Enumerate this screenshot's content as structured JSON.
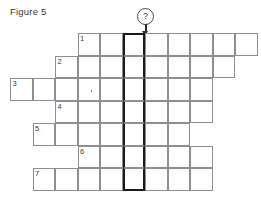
{
  "figure": {
    "label": "Figure 5"
  },
  "marker": {
    "symbol": "?",
    "name": "question-mark-pointer",
    "points_to_column": 5
  },
  "grid": {
    "cell_size": 22.5,
    "origin_x": 10,
    "origin_y": 33,
    "columns": 11,
    "rows": 7,
    "highlight_column": 5,
    "line_color": "#8e8e8e",
    "highlight_color": "#1a1a1a",
    "rows_data": [
      {
        "number": "1",
        "start_col": 3,
        "length": 8
      },
      {
        "number": "2",
        "start_col": 2,
        "length": 8
      },
      {
        "number": "3",
        "start_col": 0,
        "length": 9
      },
      {
        "number": "4",
        "start_col": 2,
        "length": 7
      },
      {
        "number": "5",
        "start_col": 1,
        "length": 7
      },
      {
        "number": "6",
        "start_col": 3,
        "length": 6
      },
      {
        "number": "7",
        "start_col": 1,
        "length": 8
      }
    ],
    "marks": [
      {
        "row": 2,
        "col": 3
      }
    ]
  }
}
